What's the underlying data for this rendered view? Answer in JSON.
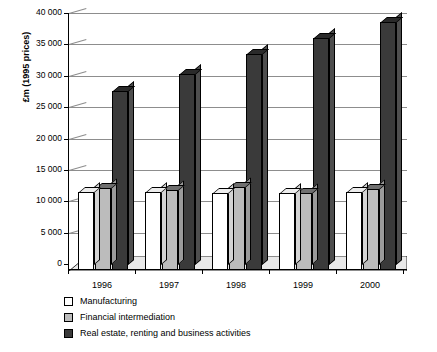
{
  "chart_data": {
    "type": "bar",
    "title": "",
    "subtitle": "",
    "xlabel": "",
    "ylabel": "£m (1995 prices)",
    "categories": [
      "1996",
      "1997",
      "1998",
      "1999",
      "2000"
    ],
    "ylim": [
      0,
      40000
    ],
    "ytick_step": 5000,
    "ytick_labels": [
      "40 000",
      "35 000",
      "30 000",
      "25 000",
      "20 000",
      "15 000",
      "10 000",
      "5 000",
      "0"
    ],
    "ytick_values": [
      40000,
      35000,
      30000,
      25000,
      20000,
      15000,
      10000,
      5000,
      0
    ],
    "grid": true,
    "legend_position": "below",
    "style": "3d-columns",
    "series": [
      {
        "name": "Manufacturing",
        "color": "#ffffff",
        "values": [
          12400,
          12400,
          12300,
          12300,
          12400
        ]
      },
      {
        "name": "Financial intermediation",
        "color": "#bcbcbc",
        "values": [
          13000,
          12700,
          13300,
          12300,
          12900
        ]
      },
      {
        "name": "Real estate, renting and business activities",
        "color": "#3a3a3a",
        "values": [
          28500,
          31200,
          34400,
          37000,
          39500
        ]
      }
    ]
  },
  "axis": {
    "y_title": "£m (1995 prices)"
  },
  "legend": {
    "items": [
      {
        "label": "Manufacturing",
        "swatch": "white-swatch-icon"
      },
      {
        "label": "Financial intermediation",
        "swatch": "gray-swatch-icon"
      },
      {
        "label": "Real estate, renting and business activities",
        "swatch": "dark-swatch-icon"
      }
    ]
  }
}
